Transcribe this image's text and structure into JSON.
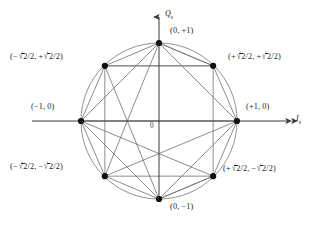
{
  "figure": {
    "type": "constellation-diagram",
    "modulation": "8-PSK",
    "origin_label": "0",
    "axes": {
      "vertical": {
        "symbol": "Q",
        "subscript": "s",
        "direction": "up"
      },
      "horizontal": {
        "symbol": "I",
        "subscript": "s",
        "direction": "right"
      }
    },
    "circle": {
      "center": [
        159,
        121
      ],
      "radius": 78,
      "color": "#7a7a7a"
    },
    "point_color": "#0f0f0f",
    "line_color": "#6e6e6e",
    "axis_color": "#4a4a4a",
    "points": [
      {
        "id": "p-90",
        "label_plain": "(0, +1)",
        "angle_deg": 90,
        "i": 0,
        "q": 1
      },
      {
        "id": "p-135",
        "label_plain": "(-√2/2, +√2/2)",
        "angle_deg": 135,
        "i": -0.7071,
        "q": 0.7071
      },
      {
        "id": "p-180",
        "label_plain": "(-1, 0)",
        "angle_deg": 180,
        "i": -1,
        "q": 0
      },
      {
        "id": "p-225",
        "label_plain": "(-√2/2, -√2/2)",
        "angle_deg": 225,
        "i": -0.7071,
        "q": -0.7071
      },
      {
        "id": "p-270",
        "label_plain": "(0, -1)",
        "angle_deg": 270,
        "i": 0,
        "q": -1
      },
      {
        "id": "p-315",
        "label_plain": "(+√2/2, -√2/2)",
        "angle_deg": 315,
        "i": 0.7071,
        "q": -0.7071
      },
      {
        "id": "p-0",
        "label_plain": "(+1, 0)",
        "angle_deg": 0,
        "i": 1,
        "q": 0
      },
      {
        "id": "p-45",
        "label_plain": "(+√2/2, +√2/2)",
        "angle_deg": 45,
        "i": 0.7071,
        "q": 0.7071
      }
    ]
  },
  "labels": {
    "top": {
      "open": "(",
      "x": "0",
      "comma": ",",
      "y": "+1",
      "close": ")"
    },
    "upper_left": {
      "open": "(",
      "x_sign": "−",
      "x_num": "2",
      "x_den": "/2",
      "comma": ",",
      "y_sign": "+",
      "y_num": "2",
      "y_den": "/2",
      "close": ")"
    },
    "upper_right": {
      "open": "(",
      "x_sign": "+",
      "x_num": "2",
      "x_den": "/2",
      "comma": ",",
      "y_sign": "+",
      "y_num": "2",
      "y_den": "/2",
      "close": ")"
    },
    "left": {
      "open": "(",
      "x": "−1",
      "comma": ",",
      "y": "0",
      "close": ")"
    },
    "right": {
      "open": "(",
      "x": "+1",
      "comma": ",",
      "y": "0",
      "close": ")"
    },
    "lower_left": {
      "open": "(",
      "x_sign": "−",
      "x_num": "2",
      "x_den": "/2",
      "comma": ",",
      "y_sign": "−",
      "y_num": "2",
      "y_den": "/2",
      "close": ")"
    },
    "lower_right": {
      "open": "(",
      "x_sign": "+",
      "x_num": "2",
      "x_den": "/2",
      "comma": ",",
      "y_sign": "−",
      "y_num": "2",
      "y_den": "/2",
      "close": ")"
    },
    "bottom": {
      "open": "(",
      "x": "0",
      "comma": ",",
      "y": "−1",
      "close": ")"
    },
    "origin": "0",
    "axis_q": "Q",
    "axis_q_sub": "s",
    "axis_i": "I",
    "axis_i_sub": "s"
  }
}
